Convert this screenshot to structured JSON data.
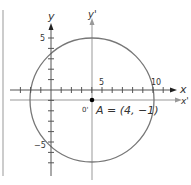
{
  "diagram": {
    "axes": {
      "x_label": "x",
      "y_label": "y",
      "x_prime_label": "x'",
      "y_prime_label": "y'",
      "origin_prime_label": "0'"
    },
    "tick_labels": {
      "x_5": "5",
      "x_10": "10",
      "y_5": "5",
      "y_neg5": "−5"
    },
    "point": {
      "label": "A = (4, −1)",
      "x": 4,
      "y": -1
    },
    "circle": {
      "center": [
        4,
        -1
      ],
      "radius": 6
    },
    "colors": {
      "axis": "#555555",
      "prime_axis": "#999999",
      "circle": "#777777",
      "point": "#000000"
    }
  }
}
